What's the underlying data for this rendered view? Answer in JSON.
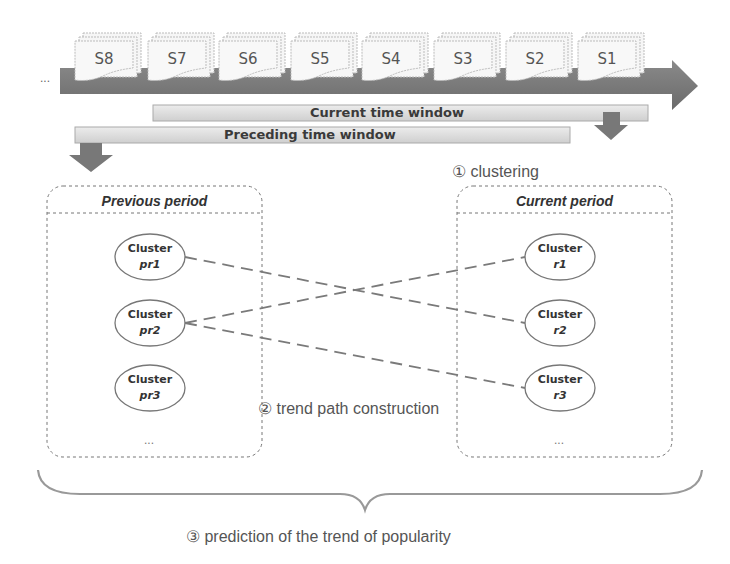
{
  "timeline": {
    "leading_ellipsis": "...",
    "segments": [
      "S8",
      "S7",
      "S6",
      "S5",
      "S4",
      "S3",
      "S2",
      "S1"
    ]
  },
  "windows": {
    "current": "Current time window",
    "preceding": "Preceding time window"
  },
  "steps": {
    "clustering": "① clustering",
    "trend_path": "② trend path construction",
    "prediction": "③ prediction of the trend of popularity"
  },
  "previous_period": {
    "title": "Previous period",
    "clusters": [
      {
        "name": "Cluster",
        "id": "pr1"
      },
      {
        "name": "Cluster",
        "id": "pr2"
      },
      {
        "name": "Cluster",
        "id": "pr3"
      }
    ],
    "more": "..."
  },
  "current_period": {
    "title": "Current period",
    "clusters": [
      {
        "name": "Cluster",
        "id": "r1"
      },
      {
        "name": "Cluster",
        "id": "r2"
      },
      {
        "name": "Cluster",
        "id": "r3"
      }
    ],
    "more": "..."
  },
  "trend_links": [
    {
      "from": "pr1",
      "to": "r2"
    },
    {
      "from": "pr2",
      "to": "r1"
    },
    {
      "from": "pr2",
      "to": "r3"
    }
  ],
  "colors": {
    "arrow": "#7a7a7a",
    "bar_fill": "#dcdcdc",
    "slide_fill": "#f4f4f4",
    "dashed_link": "#7a7a7a",
    "text": "#555555"
  }
}
